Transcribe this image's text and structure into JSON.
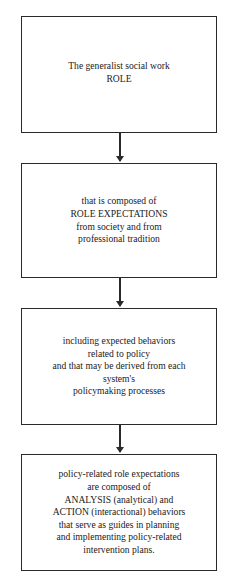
{
  "diagram": {
    "type": "flowchart",
    "direction": "top-to-bottom",
    "boxes": [
      {
        "id": "box-1",
        "text": "The generalist social work\nROLE"
      },
      {
        "id": "box-2",
        "text": "that is composed of\nROLE EXPECTATIONS\nfrom society and from\nprofessional tradition"
      },
      {
        "id": "box-3",
        "text": "including expected behaviors\nrelated to policy\nand that may be derived from each\nsystem's\npolicymaking processes"
      },
      {
        "id": "box-4",
        "text": "policy-related role expectations\nare composed of\nANALYSIS (analytical) and\nACTION (interactional) behaviors\nthat serve as guides in planning\nand implementing policy-related\nintervention plans."
      }
    ],
    "arrows": [
      {
        "from": "box-1",
        "to": "box-2"
      },
      {
        "from": "box-2",
        "to": "box-3"
      },
      {
        "from": "box-3",
        "to": "box-4"
      }
    ],
    "colors": {
      "line": "#2a2a2a",
      "background": "#ffffff",
      "text": "#222222"
    }
  }
}
